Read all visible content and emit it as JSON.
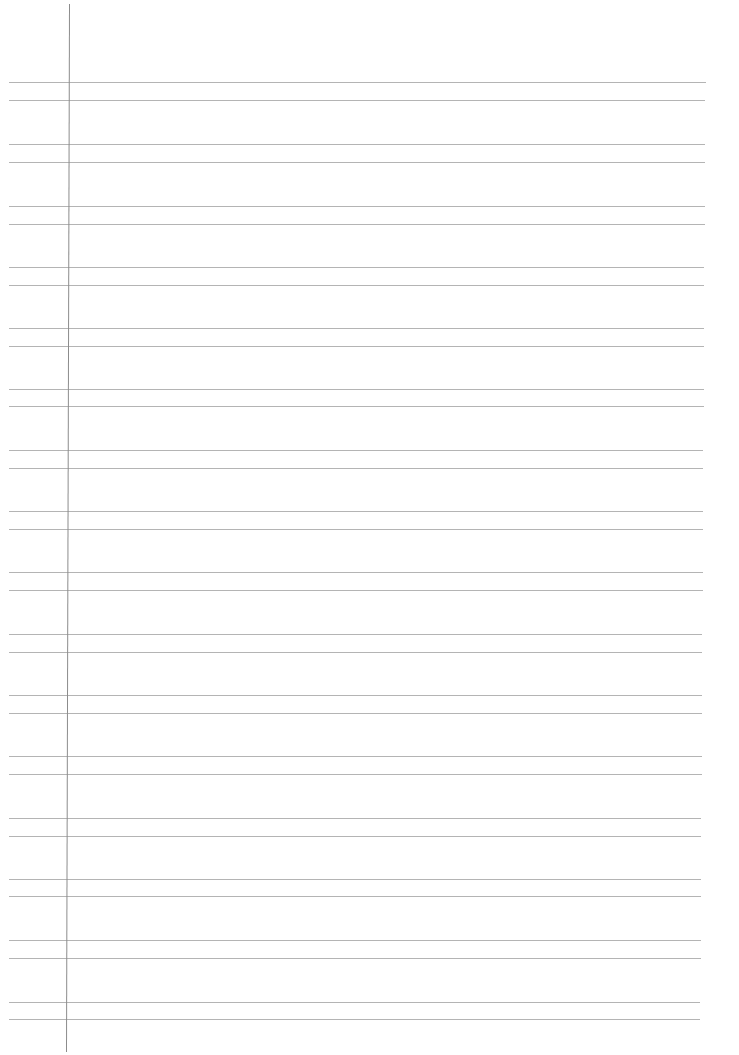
{
  "page": {
    "type": "ruled-notebook-page",
    "background_color": "#ffffff",
    "rule_color": "#b4b4b4",
    "margin_line_color": "#8c8c8c",
    "content_text": ""
  },
  "margin_line": {
    "x_top": 69,
    "x_bottom": 66,
    "y_start": 4,
    "y_end": 1052
  },
  "rule_pairs": [
    {
      "upper_y": 82,
      "lower_y": 100
    },
    {
      "upper_y": 144,
      "lower_y": 162
    },
    {
      "upper_y": 206,
      "lower_y": 224
    },
    {
      "upper_y": 267,
      "lower_y": 285
    },
    {
      "upper_y": 328,
      "lower_y": 346
    },
    {
      "upper_y": 389,
      "lower_y": 406
    },
    {
      "upper_y": 450,
      "lower_y": 468
    },
    {
      "upper_y": 511,
      "lower_y": 529
    },
    {
      "upper_y": 572,
      "lower_y": 590
    },
    {
      "upper_y": 634,
      "lower_y": 652
    },
    {
      "upper_y": 695,
      "lower_y": 713
    },
    {
      "upper_y": 756,
      "lower_y": 774
    },
    {
      "upper_y": 818,
      "lower_y": 836
    },
    {
      "upper_y": 879,
      "lower_y": 896
    },
    {
      "upper_y": 940,
      "lower_y": 958
    },
    {
      "upper_y": 1002,
      "lower_y": 1019
    }
  ],
  "rule_extent": {
    "x_start": 9,
    "x_end_top": 706,
    "x_end_bottom": 700
  }
}
